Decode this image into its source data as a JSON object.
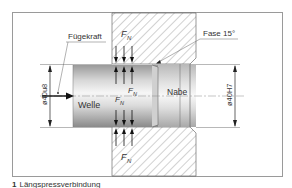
{
  "figure": {
    "labels": {
      "joining_force": "Fügekraft",
      "chamfer": "Fase 15°",
      "shaft": "Welle",
      "hub": "Nabe",
      "normal_force_symbol": "F",
      "normal_force_subscript": "N",
      "shaft_diameter": "ø40u8",
      "bore_diameter": "ø40H7"
    },
    "colors": {
      "frame": "#9a9a9a",
      "hatch": "#8c8c8c",
      "line": "#222222",
      "shaft_light": "#f4f4f4",
      "shaft_dark": "#8e8e8e"
    }
  },
  "caption": {
    "number": "1",
    "text": "Längspressverbindung"
  }
}
